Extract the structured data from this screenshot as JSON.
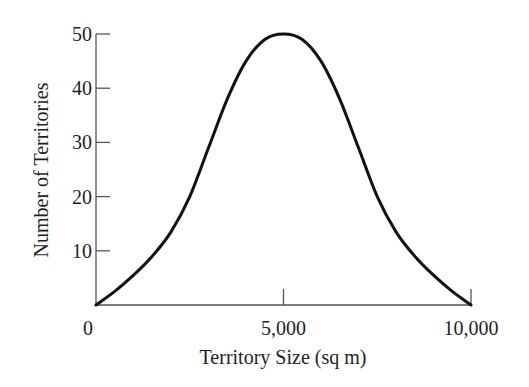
{
  "chart_data": {
    "type": "line",
    "title": "",
    "xlabel": "Territory Size (sq m)",
    "ylabel": "Number of Territories",
    "xlim": [
      0,
      10000
    ],
    "ylim": [
      0,
      50
    ],
    "grid": false,
    "legend": null,
    "x_ticks": [
      0,
      5000,
      10000
    ],
    "x_tick_labels": [
      "0",
      "5,000",
      "10,000"
    ],
    "y_ticks": [
      10,
      20,
      30,
      40,
      50
    ],
    "y_tick_labels": [
      "10",
      "20",
      "30",
      "40",
      "50"
    ],
    "series": [
      {
        "name": "Territory size distribution",
        "color": "#111111",
        "x": [
          0,
          500,
          1000,
          1500,
          2000,
          2500,
          3000,
          3500,
          4000,
          4500,
          5000,
          5500,
          6000,
          6500,
          7000,
          7500,
          8000,
          8500,
          9000,
          9500,
          10000
        ],
        "y": [
          0,
          2.5,
          5.5,
          9,
          13.5,
          20,
          29,
          38,
          45,
          49,
          50,
          49,
          45,
          38,
          29,
          20,
          13.5,
          9,
          5.5,
          2.5,
          0
        ]
      }
    ]
  }
}
